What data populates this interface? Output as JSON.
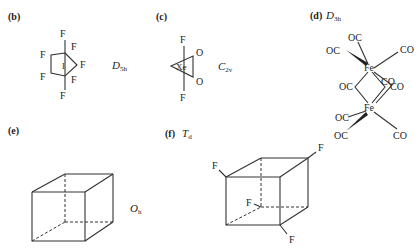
{
  "panels": {
    "b": {
      "label": "(b)",
      "central_atom": "I",
      "ligand": "F",
      "symmetry": {
        "main": "D",
        "sub": "5h"
      }
    },
    "c": {
      "label": "(c)",
      "central_atom": "Xe",
      "ligand_axial": "F",
      "ligand_equatorial": "O",
      "symmetry": {
        "main": "C",
        "sub": "2v"
      }
    },
    "d": {
      "label": "(d)",
      "metal": "Fe",
      "ligand_left": "OC",
      "ligand_right": "CO",
      "symmetry": {
        "main": "D",
        "sub": "3h"
      }
    },
    "e": {
      "label": "(e)",
      "symmetry": {
        "main": "O",
        "sub": "h"
      }
    },
    "f": {
      "label": "(f)",
      "ligand": "F",
      "symmetry": {
        "main": "T",
        "sub": "d"
      }
    }
  }
}
